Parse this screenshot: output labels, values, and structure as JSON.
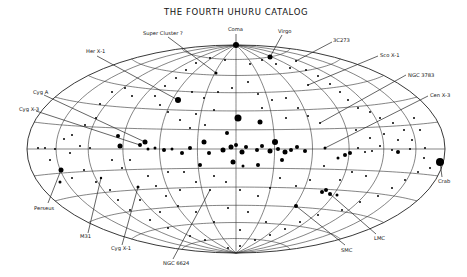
{
  "title": "THE FOURTH UHURU CATALOG",
  "projection": {
    "cx": 236,
    "cy": 149,
    "rx": 209,
    "ry": 104
  },
  "labels": [
    {
      "text": "Coma",
      "x": 228,
      "y": 31,
      "lx1": 236,
      "ly1": 34,
      "lx2": 236,
      "ly2": 45
    },
    {
      "text": "Virgo",
      "x": 278,
      "y": 33,
      "lx1": 282,
      "ly1": 35,
      "lx2": 270,
      "ly2": 57
    },
    {
      "text": "Super Cluster ?",
      "x": 143,
      "y": 35,
      "lx1": 168,
      "ly1": 37,
      "lx2": 216,
      "ly2": 73
    },
    {
      "text": "3C273",
      "x": 333,
      "y": 42,
      "lx1": 332,
      "ly1": 42,
      "lx2": 296,
      "ly2": 61
    },
    {
      "text": "Her X-1",
      "x": 86,
      "y": 53,
      "lx1": 97,
      "ly1": 56,
      "lx2": 178,
      "ly2": 100
    },
    {
      "text": "Sco X-1",
      "x": 380,
      "y": 57,
      "lx1": 378,
      "ly1": 56,
      "lx2": 308,
      "ly2": 85
    },
    {
      "text": "NGC 3783",
      "x": 408,
      "y": 77,
      "lx1": 406,
      "ly1": 75,
      "lx2": 320,
      "ly2": 123
    },
    {
      "text": "Cen X-3",
      "x": 430,
      "y": 97,
      "lx1": 428,
      "ly1": 96,
      "lx2": 325,
      "ly2": 148
    },
    {
      "text": "Cyg A",
      "x": 33,
      "y": 94,
      "lx1": 44,
      "ly1": 95,
      "lx2": 145,
      "ly2": 142
    },
    {
      "text": "Cyg X-3",
      "x": 19,
      "y": 111,
      "lx1": 36,
      "ly1": 111,
      "lx2": 140,
      "ly2": 145
    },
    {
      "text": "Crab",
      "x": 438,
      "y": 183,
      "lx1": 442,
      "ly1": 177,
      "lx2": 440,
      "ly2": 162
    },
    {
      "text": "Perseus",
      "x": 34,
      "y": 210,
      "lx1": 48,
      "ly1": 203,
      "lx2": 61,
      "ly2": 170
    },
    {
      "text": "M31",
      "x": 80,
      "y": 238,
      "lx1": 88,
      "ly1": 233,
      "lx2": 101,
      "ly2": 178
    },
    {
      "text": "Cyg X-1",
      "x": 111,
      "y": 250,
      "lx1": 122,
      "ly1": 245,
      "lx2": 138,
      "ly2": 187
    },
    {
      "text": "NGC 6624",
      "x": 163,
      "y": 265,
      "lx1": 173,
      "ly1": 259,
      "lx2": 210,
      "ly2": 190
    },
    {
      "text": "SMC",
      "x": 341,
      "y": 252,
      "lx1": 345,
      "ly1": 245,
      "lx2": 296,
      "ly2": 206
    },
    {
      "text": "LMC",
      "x": 374,
      "y": 240,
      "lx1": 376,
      "ly1": 234,
      "lx2": 330,
      "ly2": 194
    }
  ],
  "sources": [
    [
      236,
      45,
      3
    ],
    [
      270,
      57,
      2.5
    ],
    [
      216,
      73,
      1.5
    ],
    [
      296,
      61,
      1
    ],
    [
      178,
      100,
      3
    ],
    [
      308,
      85,
      1
    ],
    [
      320,
      123,
      1
    ],
    [
      325,
      148,
      1.5
    ],
    [
      145,
      142,
      2.5
    ],
    [
      140,
      145,
      2
    ],
    [
      440,
      162,
      4
    ],
    [
      61,
      170,
      2.5
    ],
    [
      101,
      178,
      1.2
    ],
    [
      138,
      187,
      1.5
    ],
    [
      210,
      190,
      1
    ],
    [
      296,
      206,
      2
    ],
    [
      330,
      194,
      2
    ],
    [
      322,
      192,
      2
    ],
    [
      326,
      190,
      2
    ],
    [
      337,
      195,
      1.5
    ],
    [
      238,
      118,
      3.5
    ],
    [
      260,
      122,
      2.5
    ],
    [
      227,
      133,
      2
    ],
    [
      204,
      142,
      2.5
    ],
    [
      190,
      148,
      2
    ],
    [
      209,
      153,
      2
    ],
    [
      223,
      150,
      2.5
    ],
    [
      231,
      147,
      2.5
    ],
    [
      236,
      145,
      2
    ],
    [
      242,
      152,
      2.5
    ],
    [
      246,
      147,
      2
    ],
    [
      257,
      150,
      2
    ],
    [
      262,
      146,
      2
    ],
    [
      270,
      151,
      2.5
    ],
    [
      278,
      149,
      2
    ],
    [
      285,
      152,
      2.5
    ],
    [
      291,
      150,
      2
    ],
    [
      297,
      147,
      2
    ],
    [
      305,
      151,
      2
    ],
    [
      275,
      142,
      3
    ],
    [
      282,
      160,
      2
    ],
    [
      258,
      165,
      2
    ],
    [
      233,
      162,
      2.5
    ],
    [
      243,
      166,
      1.5
    ],
    [
      200,
      165,
      2
    ],
    [
      182,
      153,
      2
    ],
    [
      172,
      149,
      1.5
    ],
    [
      164,
      150,
      2
    ],
    [
      155,
      148,
      1.5
    ],
    [
      148,
      149,
      1.5
    ],
    [
      120,
      146,
      2.5
    ],
    [
      118,
      136,
      2
    ],
    [
      90,
      148,
      1
    ],
    [
      80,
      146,
      1
    ],
    [
      70,
      153,
      1
    ],
    [
      55,
      149,
      1
    ],
    [
      45,
      148,
      1
    ],
    [
      38,
      148,
      1
    ],
    [
      324,
      166,
      1
    ],
    [
      338,
      158,
      1.5
    ],
    [
      345,
      155,
      2
    ],
    [
      350,
      153,
      2
    ],
    [
      358,
      148,
      1
    ],
    [
      365,
      152,
      1
    ],
    [
      372,
      151,
      1
    ],
    [
      380,
      146,
      1
    ],
    [
      392,
      150,
      1
    ],
    [
      398,
      152,
      2
    ],
    [
      410,
      149,
      1
    ],
    [
      425,
      148,
      1
    ],
    [
      180,
      120,
      1
    ],
    [
      168,
      112,
      1
    ],
    [
      160,
      105,
      1
    ],
    [
      155,
      96,
      1
    ],
    [
      132,
      96,
      1
    ],
    [
      125,
      88,
      1
    ],
    [
      112,
      92,
      1
    ],
    [
      100,
      104,
      1
    ],
    [
      96,
      118,
      1
    ],
    [
      85,
      125,
      1
    ],
    [
      72,
      135,
      1
    ],
    [
      64,
      139,
      1
    ],
    [
      50,
      160,
      1
    ],
    [
      60,
      182,
      1.5
    ],
    [
      72,
      178,
      1
    ],
    [
      84,
      170,
      1
    ],
    [
      96,
      182,
      1
    ],
    [
      110,
      190,
      1
    ],
    [
      118,
      200,
      1
    ],
    [
      130,
      210,
      1
    ],
    [
      150,
      220,
      1
    ],
    [
      168,
      228,
      1
    ],
    [
      190,
      236,
      1
    ],
    [
      205,
      240,
      1
    ],
    [
      228,
      248,
      1
    ],
    [
      240,
      246,
      1
    ],
    [
      255,
      240,
      1
    ],
    [
      270,
      235,
      1
    ],
    [
      285,
      229,
      1
    ],
    [
      300,
      222,
      1
    ],
    [
      318,
      215,
      1
    ],
    [
      342,
      210,
      1
    ],
    [
      360,
      202,
      1
    ],
    [
      378,
      196,
      1
    ],
    [
      392,
      188,
      1
    ],
    [
      405,
      180,
      1
    ],
    [
      418,
      172,
      1
    ],
    [
      430,
      168,
      1
    ],
    [
      424,
      158,
      1
    ],
    [
      412,
      140,
      1
    ],
    [
      404,
      130,
      1
    ],
    [
      393,
      123,
      1
    ],
    [
      380,
      118,
      1
    ],
    [
      370,
      112,
      1
    ],
    [
      358,
      108,
      1
    ],
    [
      348,
      100,
      1
    ],
    [
      340,
      92,
      1
    ],
    [
      330,
      84,
      1
    ],
    [
      318,
      76,
      1
    ],
    [
      306,
      70,
      1
    ],
    [
      290,
      68,
      1
    ],
    [
      276,
      64,
      1
    ],
    [
      262,
      60,
      1
    ],
    [
      250,
      64,
      1
    ],
    [
      225,
      60,
      1
    ],
    [
      210,
      58,
      1
    ],
    [
      196,
      63,
      1
    ],
    [
      186,
      70,
      1
    ],
    [
      176,
      78,
      1
    ],
    [
      165,
      86,
      1
    ],
    [
      192,
      92,
      1
    ],
    [
      204,
      98,
      1
    ],
    [
      218,
      92,
      1
    ],
    [
      232,
      88,
      1
    ],
    [
      248,
      82,
      1
    ],
    [
      258,
      94,
      1
    ],
    [
      272,
      100,
      1
    ],
    [
      286,
      98,
      1
    ],
    [
      298,
      108,
      1
    ],
    [
      308,
      116,
      1
    ],
    [
      286,
      118,
      1
    ],
    [
      262,
      108,
      1
    ],
    [
      214,
      110,
      1
    ],
    [
      196,
      114,
      1
    ],
    [
      190,
      128,
      1
    ],
    [
      205,
      125,
      1
    ],
    [
      352,
      172,
      1
    ],
    [
      366,
      176,
      1
    ],
    [
      340,
      180,
      1
    ],
    [
      310,
      180,
      1
    ],
    [
      296,
      186,
      1
    ],
    [
      280,
      178,
      1
    ],
    [
      270,
      188,
      1
    ],
    [
      258,
      196,
      1
    ],
    [
      240,
      190,
      1
    ],
    [
      226,
      182,
      1
    ],
    [
      214,
      176,
      1
    ],
    [
      196,
      182,
      1
    ],
    [
      180,
      190,
      1
    ],
    [
      166,
      196,
      1
    ],
    [
      156,
      186,
      1
    ],
    [
      148,
      176,
      1
    ],
    [
      168,
      172,
      1
    ],
    [
      184,
      172,
      1
    ],
    [
      228,
      208,
      1
    ],
    [
      248,
      212,
      1
    ],
    [
      266,
      222,
      1
    ],
    [
      240,
      230,
      1
    ],
    [
      214,
      222,
      1
    ],
    [
      196,
      212,
      1
    ],
    [
      178,
      206,
      1
    ],
    [
      160,
      212,
      1
    ],
    [
      140,
      200,
      1
    ],
    [
      122,
      168,
      1
    ],
    [
      112,
      160,
      1
    ],
    [
      130,
      160,
      1
    ],
    [
      356,
      130,
      1
    ],
    [
      370,
      138,
      1
    ],
    [
      384,
      134,
      1
    ],
    [
      398,
      140,
      1
    ],
    [
      414,
      118,
      1
    ],
    [
      420,
      130,
      1
    ]
  ]
}
